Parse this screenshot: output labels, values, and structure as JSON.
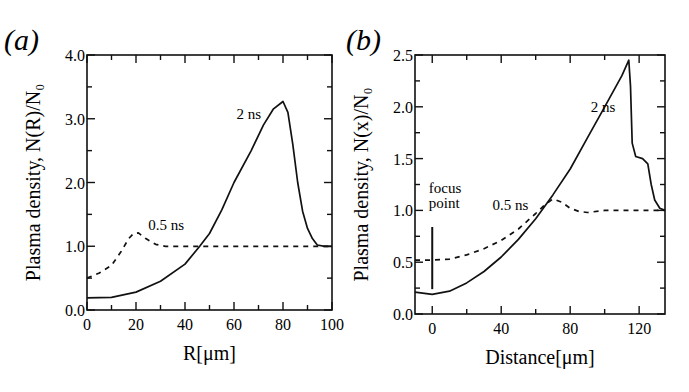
{
  "chart_data": [
    {
      "panel": "(a)",
      "type": "line",
      "xlabel": "R[μm]",
      "ylabel": "Plasma density, N(R)/N₀",
      "xlim": [
        0,
        100
      ],
      "ylim": [
        0,
        4.0
      ],
      "xticks": [
        0,
        20,
        40,
        60,
        80,
        100
      ],
      "xtick_labels": [
        "0",
        "20",
        "40",
        "60",
        "80",
        "100"
      ],
      "yticks": [
        0,
        1,
        2,
        3,
        4
      ],
      "ytick_labels": [
        "0.0",
        "1.0",
        "2.0",
        "3.0",
        "4.0"
      ],
      "grid": false,
      "legend": "none (inline annotations)",
      "series": [
        {
          "name": "2 ns",
          "style": "solid",
          "x": [
            0,
            10,
            20,
            30,
            40,
            46,
            50,
            55,
            60,
            67,
            72,
            76,
            80,
            82,
            84,
            86,
            88,
            90,
            92,
            94,
            97,
            100
          ],
          "y": [
            0.19,
            0.2,
            0.28,
            0.45,
            0.72,
            1.0,
            1.2,
            1.57,
            2.0,
            2.5,
            2.9,
            3.15,
            3.27,
            3.1,
            2.6,
            2.0,
            1.55,
            1.28,
            1.12,
            1.02,
            1.0,
            1.0
          ]
        },
        {
          "name": "0.5 ns",
          "style": "dashed",
          "x": [
            0,
            5,
            10,
            14,
            17,
            19,
            21,
            24,
            28,
            32,
            40,
            60,
            80,
            100
          ],
          "y": [
            0.5,
            0.58,
            0.7,
            0.92,
            1.12,
            1.2,
            1.21,
            1.12,
            1.03,
            1.0,
            1.0,
            1.0,
            1.0,
            1.0
          ]
        }
      ],
      "annotations": [
        {
          "text": "2 ns",
          "x": 61,
          "y": 3.0
        },
        {
          "text": "0.5 ns",
          "x": 25,
          "y": 1.25
        }
      ]
    },
    {
      "panel": "(b)",
      "type": "line",
      "xlabel": "Distance[μm]",
      "ylabel": "Plasma density, N(x)/N₀",
      "xlim": [
        -10,
        135
      ],
      "ylim": [
        0,
        2.5
      ],
      "xticks": [
        0,
        40,
        80,
        120
      ],
      "xtick_labels": [
        "0",
        "40",
        "80",
        "120"
      ],
      "yticks": [
        0,
        0.5,
        1.0,
        1.5,
        2.0,
        2.5
      ],
      "ytick_labels": [
        "0.0",
        "0.5",
        "1.0",
        "1.5",
        "2.0",
        "2.5"
      ],
      "grid": false,
      "legend": "none (inline annotations)",
      "series": [
        {
          "name": "2 ns",
          "style": "solid",
          "x": [
            -10,
            0,
            10,
            20,
            30,
            40,
            50,
            60,
            70,
            80,
            90,
            100,
            110,
            114,
            115,
            116,
            118,
            122,
            125,
            127,
            129,
            132,
            135
          ],
          "y": [
            0.21,
            0.19,
            0.22,
            0.3,
            0.41,
            0.55,
            0.72,
            0.92,
            1.15,
            1.4,
            1.7,
            2.0,
            2.3,
            2.45,
            2.2,
            1.65,
            1.52,
            1.5,
            1.45,
            1.25,
            1.1,
            1.02,
            1.0
          ]
        },
        {
          "name": "0.5 ns",
          "style": "dashed",
          "x": [
            -10,
            0,
            10,
            20,
            30,
            40,
            50,
            60,
            65,
            70,
            75,
            80,
            85,
            90,
            100,
            110,
            120,
            135
          ],
          "y": [
            0.52,
            0.52,
            0.53,
            0.57,
            0.63,
            0.71,
            0.82,
            0.97,
            1.05,
            1.11,
            1.08,
            1.02,
            0.99,
            0.98,
            1.0,
            1.0,
            1.0,
            1.0
          ]
        }
      ],
      "annotations": [
        {
          "text": "2 ns",
          "x": 92,
          "y": 1.95
        },
        {
          "text": "0.5 ns",
          "x": 35,
          "y": 1.0
        },
        {
          "text": "focus",
          "x": -2,
          "y": 1.17
        },
        {
          "text": "point",
          "x": -2,
          "y": 1.02
        }
      ],
      "markers": [
        {
          "name": "focus-point-line",
          "x": 0,
          "y0": 0.24,
          "y1": 0.84
        }
      ]
    }
  ],
  "labels": {
    "panel_a": "(a)",
    "panel_b": "(b)"
  }
}
